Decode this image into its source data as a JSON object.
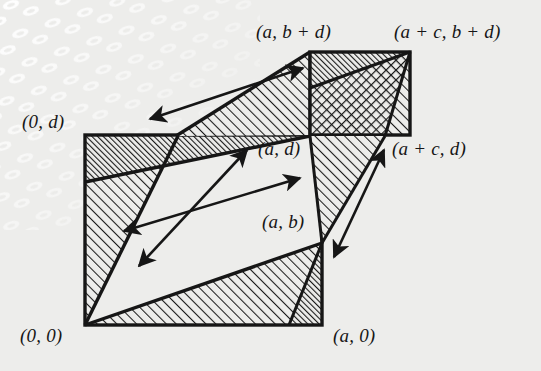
{
  "figure": {
    "background_color": "#ededeb",
    "ink_color": "#161616",
    "labels": [
      {
        "id": "label-a-bplusd",
        "text": "(a, b + d)",
        "x": 256,
        "y": 22
      },
      {
        "id": "label-aplusc-bplusd",
        "text": "(a + c, b + d)",
        "x": 394,
        "y": 22
      },
      {
        "id": "label-0-d",
        "text": "(0, d)",
        "x": 22,
        "y": 112
      },
      {
        "id": "label-a-d",
        "text": "(a, d)",
        "x": 258,
        "y": 139
      },
      {
        "id": "label-aplusc-d",
        "text": "(a + c, d)",
        "x": 392,
        "y": 139
      },
      {
        "id": "label-a-b",
        "text": "(a, b)",
        "x": 262,
        "y": 212
      },
      {
        "id": "label-0-0",
        "text": "(0, 0)",
        "x": 20,
        "y": 326
      },
      {
        "id": "label-a-0",
        "text": "(a, 0)",
        "x": 333,
        "y": 326
      }
    ],
    "geometry": {
      "points": {
        "origin": {
          "name": "(0, 0)",
          "x": 85,
          "y": 325
        },
        "zero_d": {
          "name": "(0, d)",
          "x": 85,
          "y": 135
        },
        "a_zero": {
          "name": "(a, 0)",
          "x": 322,
          "y": 325
        },
        "a_b": {
          "name": "(a, b)",
          "x": 322,
          "y": 243
        },
        "a_d": {
          "name": "(a, d)",
          "x": 310,
          "y": 135
        },
        "a_bplusd": {
          "name": "(a, b + d)",
          "x": 310,
          "y": 52
        },
        "aplusc_d": {
          "name": "(a + c, d)",
          "x": 410,
          "y": 135
        },
        "aplusc_bplusd": {
          "name": "(a + c, b + d)",
          "x": 410,
          "y": 52
        },
        "c_d_lower": {
          "name": "(c, d) lower",
          "x": 175,
          "y": 135
        }
      },
      "arrows": [
        {
          "id": "arrow-upper-parallel",
          "x1": 148,
          "y1": 120,
          "x2": 305,
          "y2": 67,
          "heads": "both"
        },
        {
          "id": "arrow-middle-parallel",
          "x1": 122,
          "y1": 232,
          "x2": 302,
          "y2": 177,
          "heads": "both"
        },
        {
          "id": "arrow-diagonal-cross",
          "x1": 137,
          "y1": 268,
          "x2": 248,
          "y2": 148,
          "heads": "both"
        },
        {
          "id": "arrow-right-parallel",
          "x1": 332,
          "y1": 260,
          "x2": 386,
          "y2": 148,
          "heads": "both"
        }
      ]
    }
  }
}
